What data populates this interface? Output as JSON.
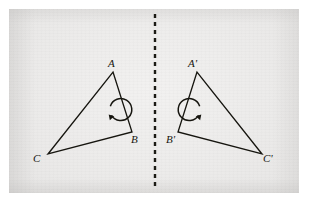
{
  "figure": {
    "width": 310,
    "height": 204,
    "background_color": "#ffffff",
    "panel_color": "#eeedec",
    "ink_color": "#16150f"
  },
  "mirror_line": {
    "name": "mirror-line",
    "style": "dashed",
    "orientation": "vertical",
    "x": 155,
    "y_start": 14,
    "y_end": 190,
    "color": "#1c1b15",
    "dash": "4 4",
    "width": 2.4
  },
  "shapes": [
    {
      "name": "triangle-original",
      "labels": [
        "A",
        "B",
        "C"
      ],
      "vertices": [
        {
          "label": "A",
          "x": 113,
          "y": 72
        },
        {
          "label": "B",
          "x": 132,
          "y": 132
        },
        {
          "label": "C",
          "x": 48,
          "y": 154
        }
      ],
      "label_positions": [
        {
          "label": "A",
          "x": 108,
          "y": 58
        },
        {
          "label": "B",
          "x": 131,
          "y": 134
        },
        {
          "label": "C",
          "x": 33,
          "y": 153
        }
      ],
      "orientation_marker": {
        "name": "orientation-arrow-clockwise",
        "direction": "clockwise",
        "center_x": 101,
        "center_y": 112,
        "radius": 11
      }
    },
    {
      "name": "triangle-image",
      "labels": [
        "A'",
        "B'",
        "C'"
      ],
      "vertices": [
        {
          "label": "A'",
          "x": 197,
          "y": 72
        },
        {
          "label": "B'",
          "x": 178,
          "y": 132
        },
        {
          "label": "C'",
          "x": 262,
          "y": 154
        }
      ],
      "label_positions": [
        {
          "label": "A'",
          "x": 188,
          "y": 58
        },
        {
          "label": "B'",
          "x": 166,
          "y": 134
        },
        {
          "label": "C'",
          "x": 263,
          "y": 153
        }
      ],
      "orientation_marker": {
        "name": "orientation-arrow-counterclockwise",
        "direction": "counterclockwise",
        "center_x": 209,
        "center_y": 112,
        "radius": 11
      }
    }
  ],
  "stroke": {
    "triangle_width": 1.3,
    "arrow_width": 1.5
  }
}
